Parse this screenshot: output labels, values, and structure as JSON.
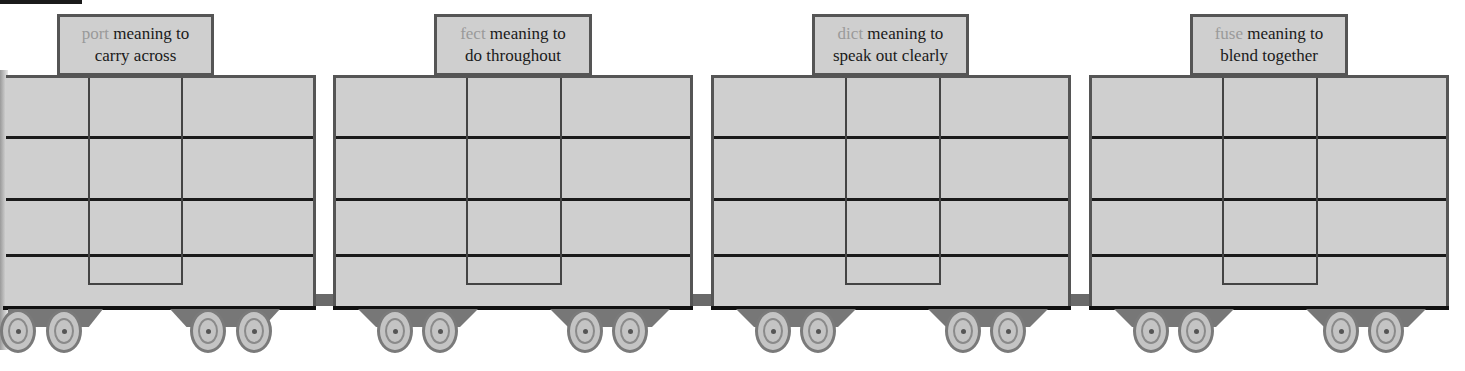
{
  "diagram": {
    "type": "train-word-roots",
    "cars": [
      {
        "root": "port",
        "meaning_line1": " meaning to",
        "meaning_line2": "carry across"
      },
      {
        "root": "fect",
        "meaning_line1": " meaning to",
        "meaning_line2": "do throughout"
      },
      {
        "root": "dict",
        "meaning_line1": " meaning to",
        "meaning_line2": "speak out clearly"
      },
      {
        "root": "fuse",
        "meaning_line1": " meaning to",
        "meaning_line2": "blend together"
      }
    ],
    "colors": {
      "car_fill": "#cfcfcf",
      "border": "#555555",
      "root_text": "#9a9a9a",
      "text": "#1a1a1a"
    }
  }
}
